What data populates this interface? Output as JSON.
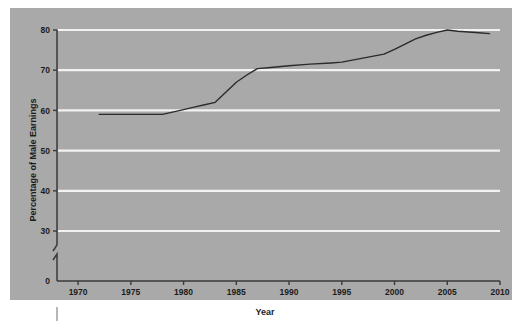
{
  "figure": {
    "panel_color": "#a9a9a9",
    "page_color": "#ffffff",
    "gridline_color": "#f2f2f2",
    "line_color": "#2b2b2b",
    "axis_color": "#3a3a3a"
  },
  "chart_data": {
    "type": "line",
    "title": "",
    "xlabel": "Year",
    "ylabel": "Percentage of Male Earnings",
    "xlim": [
      1968,
      2010
    ],
    "ylim": [
      0,
      80
    ],
    "y_axis_break": true,
    "y_break_between": [
      0,
      30
    ],
    "grid": true,
    "gridlines_horizontal": [
      30,
      40,
      50,
      60,
      70,
      80
    ],
    "legend": "none",
    "xticks": [
      1970,
      1975,
      1980,
      1985,
      1990,
      1995,
      2000,
      2005,
      2010
    ],
    "xtick_labels": [
      "1970",
      "1975",
      "1980",
      "1985",
      "1990",
      "1995",
      "2000",
      "2005",
      "2010"
    ],
    "yticks": [
      0,
      30,
      40,
      50,
      60,
      70,
      80
    ],
    "ytick_labels": [
      "0",
      "30",
      "40",
      "50",
      "60",
      "70",
      "80"
    ],
    "series": [
      {
        "name": "Women's earnings as percentage of male earnings",
        "x": [
          1972,
          1974,
          1976,
          1978,
          1980,
          1981,
          1982,
          1983,
          1984,
          1985,
          1986,
          1987,
          1988,
          1990,
          1992,
          1994,
          1995,
          1996,
          1997,
          1998,
          1999,
          2000,
          2001,
          2002,
          2003,
          2004,
          2005,
          2006,
          2007,
          2008,
          2009
        ],
        "values": [
          59.0,
          59.0,
          59.0,
          59.0,
          60.2,
          60.8,
          61.4,
          62.0,
          64.5,
          67.0,
          68.8,
          70.4,
          70.6,
          71.1,
          71.5,
          71.8,
          72.0,
          72.5,
          73.0,
          73.5,
          74.0,
          75.2,
          76.5,
          77.8,
          78.7,
          79.4,
          80.0,
          79.7,
          79.5,
          79.3,
          79.1
        ]
      }
    ]
  }
}
